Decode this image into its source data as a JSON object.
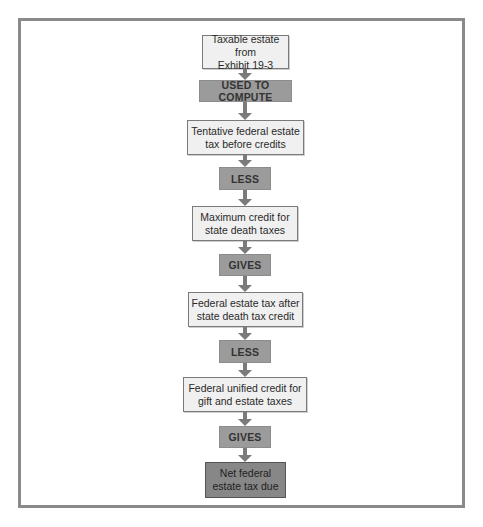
{
  "diagram": {
    "type": "flowchart",
    "direction": "top-to-bottom",
    "nodes": [
      {
        "id": "taxable_estate",
        "kind": "input",
        "lines": [
          "Taxable estate from",
          "Exhibit 19-3"
        ]
      },
      {
        "id": "op_used",
        "kind": "operator",
        "label": "USED TO COMPUTE"
      },
      {
        "id": "tentative",
        "kind": "value",
        "lines": [
          "Tentative federal estate",
          "tax before credits"
        ]
      },
      {
        "id": "op_less1",
        "kind": "operator",
        "label": "LESS"
      },
      {
        "id": "max_credit",
        "kind": "value",
        "lines": [
          "Maximum credit for",
          "state death taxes"
        ]
      },
      {
        "id": "op_gives1",
        "kind": "operator",
        "label": "GIVES"
      },
      {
        "id": "after_state",
        "kind": "value",
        "lines": [
          "Federal estate tax after",
          "state death tax credit"
        ]
      },
      {
        "id": "op_less2",
        "kind": "operator",
        "label": "LESS"
      },
      {
        "id": "unified",
        "kind": "value",
        "lines": [
          "Federal unified credit for",
          "gift and estate taxes"
        ]
      },
      {
        "id": "op_gives2",
        "kind": "operator",
        "label": "GIVES"
      },
      {
        "id": "net_due",
        "kind": "result",
        "lines": [
          "Net federal",
          "estate tax due"
        ]
      }
    ],
    "edges": [
      [
        "taxable_estate",
        "op_used"
      ],
      [
        "op_used",
        "tentative"
      ],
      [
        "tentative",
        "op_less1"
      ],
      [
        "op_less1",
        "max_credit"
      ],
      [
        "max_credit",
        "op_gives1"
      ],
      [
        "op_gives1",
        "after_state"
      ],
      [
        "after_state",
        "op_less2"
      ],
      [
        "op_less2",
        "unified"
      ],
      [
        "unified",
        "op_gives2"
      ],
      [
        "op_gives2",
        "net_due"
      ]
    ]
  },
  "colors": {
    "frame": "#8a8a8a",
    "box_fill": "#f0f0f0",
    "operator_fill": "#9b9b9b",
    "result_fill": "#878787",
    "arrow": "#7b7b7b"
  }
}
